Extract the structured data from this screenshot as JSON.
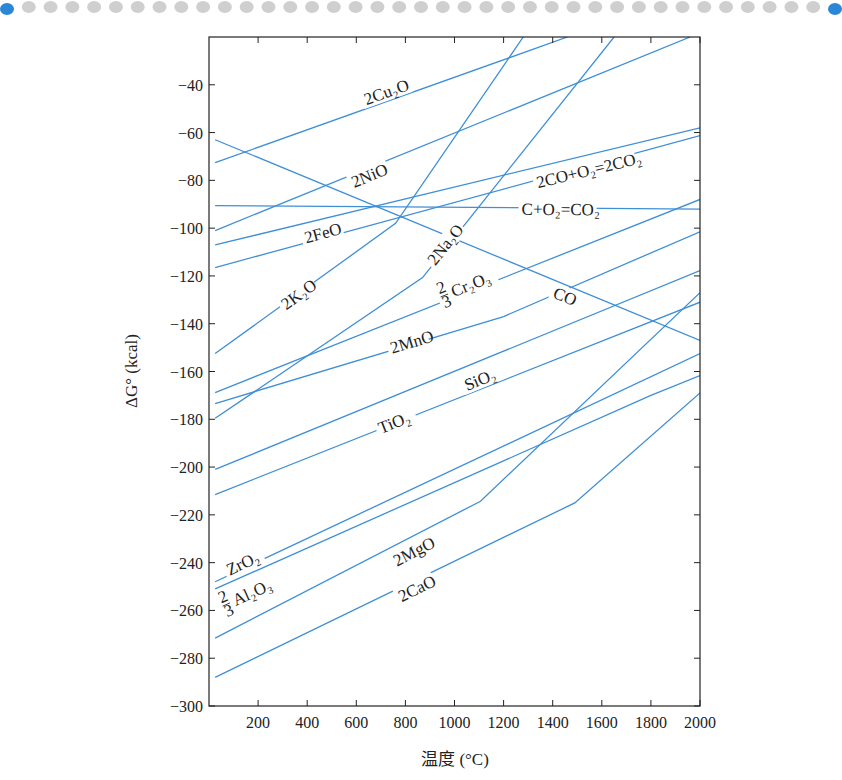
{
  "header": {
    "dot_count": 39,
    "dot_colors": {
      "end": "#2b86d6",
      "middle": "#cfcfcf"
    }
  },
  "chart_data": {
    "type": "line",
    "title": "",
    "xlabel": "温度 (°C)",
    "ylabel": "ΔG° (kcal)",
    "xlim": [
      0,
      2000
    ],
    "ylim": [
      -300,
      -20
    ],
    "xticks": [
      200,
      400,
      600,
      800,
      1000,
      1200,
      1400,
      1600,
      1800,
      2000
    ],
    "xtick_labels": [
      "200",
      "400",
      "600",
      "800",
      "1000",
      "1200",
      "1400",
      "1600",
      "1800",
      "2000"
    ],
    "yticks": [
      -40,
      -60,
      -80,
      -100,
      -120,
      -140,
      -160,
      -180,
      -200,
      -220,
      -240,
      -260,
      -280,
      -300
    ],
    "ytick_labels": [
      "−40",
      "−60",
      "−80",
      "−100",
      "−120",
      "−140",
      "−160",
      "−180",
      "−200",
      "−220",
      "−240",
      "−260",
      "−280",
      "−300"
    ],
    "grid": false,
    "line_color": "#3f8fd6",
    "series": [
      {
        "name": "2Cu2O",
        "label": "2Cu₂O",
        "x": [
          25,
          1460
        ],
        "y": [
          -72.6,
          -20
        ],
        "label_at": [
          720,
          -43
        ]
      },
      {
        "name": "2NiO",
        "label": "2NiO",
        "x": [
          25,
          1960
        ],
        "y": [
          -101,
          -20
        ],
        "label_at": [
          650,
          -78
        ]
      },
      {
        "name": "2CO+O2=2CO2",
        "label": "2CO+O₂=2CO₂",
        "x": [
          25,
          2000
        ],
        "y": [
          -107,
          -58
        ],
        "label_at": [
          1530,
          -76
        ]
      },
      {
        "name": "C+O2=CO2",
        "label": "C+O₂=CO₂",
        "x": [
          25,
          2000
        ],
        "y": [
          -90.6,
          -92
        ],
        "label_at": [
          1420,
          -92
        ]
      },
      {
        "name": "2FeO",
        "label": "2FeO",
        "x": [
          25,
          2000
        ],
        "y": [
          -116.5,
          -61.3
        ],
        "label_at": [
          460,
          -102
        ]
      },
      {
        "name": "2K2O",
        "label": "2K₂O",
        "x": [
          25,
          760,
          1280
        ],
        "y": [
          -152.5,
          -98,
          -20
        ],
        "label_at": [
          360,
          -128
        ]
      },
      {
        "name": "2Na2O",
        "label": "2Na₂O",
        "x": [
          25,
          870,
          1650
        ],
        "y": [
          -179.6,
          -120.7,
          -20
        ],
        "label_at": [
          960,
          -107
        ]
      },
      {
        "name": "CO",
        "label": "CO",
        "x": [
          25,
          2000
        ],
        "y": [
          -63,
          -147
        ],
        "label_at": [
          1440,
          -128
        ]
      },
      {
        "name": "2/3Cr2O3",
        "label": "Cr₂O₃",
        "label_prefix": "2/3",
        "x": [
          25,
          2000
        ],
        "y": [
          -168.8,
          -88
        ],
        "label_at": [
          1050,
          -124
        ]
      },
      {
        "name": "2MnO",
        "label": "2MnO",
        "x": [
          25,
          1200,
          2000
        ],
        "y": [
          -173.4,
          -137,
          -101.5
        ],
        "label_at": [
          810,
          -148
        ]
      },
      {
        "name": "SiO2",
        "label": "SiO₂",
        "x": [
          25,
          2000
        ],
        "y": [
          -201,
          -117.8
        ],
        "label_at": [
          1110,
          -163
        ]
      },
      {
        "name": "TiO2",
        "label": "TiO₂",
        "x": [
          25,
          2000
        ],
        "y": [
          -211.5,
          -131
        ],
        "label_at": [
          760,
          -181
        ]
      },
      {
        "name": "ZrO2",
        "label": "ZrO₂",
        "x": [
          25,
          2000
        ],
        "y": [
          -248,
          -152.5
        ],
        "label_at": [
          140,
          -240
        ]
      },
      {
        "name": "2/3Al2O3",
        "label": "Al₂O₃",
        "label_prefix": "2/3",
        "x": [
          25,
          1800,
          2000
        ],
        "y": [
          -251,
          -170,
          -161.7
        ],
        "label_at": [
          160,
          -253
        ]
      },
      {
        "name": "2MgO",
        "label": "2MgO",
        "x": [
          25,
          1106,
          2000
        ],
        "y": [
          -271.6,
          -214.3,
          -127
        ],
        "label_at": [
          820,
          -236
        ]
      },
      {
        "name": "2CaO",
        "label": "2CaO",
        "x": [
          25,
          1490,
          2000
        ],
        "y": [
          -288,
          -215,
          -169
        ],
        "label_at": [
          840,
          -251
        ]
      }
    ]
  }
}
